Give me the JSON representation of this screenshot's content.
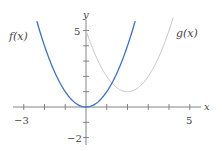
{
  "chart_data": {
    "type": "line",
    "title": "",
    "xlabel": "x",
    "ylabel": "y",
    "xlim": [
      -4,
      6
    ],
    "ylim": [
      -2.5,
      6
    ],
    "grid": false,
    "x_ticks": [
      -3,
      -2,
      -1,
      0,
      1,
      2,
      3,
      4,
      5
    ],
    "y_ticks": [
      -2,
      -1,
      0,
      1,
      2,
      3,
      4,
      5
    ],
    "x_tick_labels": [
      {
        "value": -3,
        "label": "−3"
      },
      {
        "value": 5,
        "label": "5"
      }
    ],
    "y_tick_labels": [
      {
        "value": 5,
        "label": "5"
      },
      {
        "value": -2,
        "label": "−2"
      }
    ],
    "series": [
      {
        "name": "f(x)",
        "formula": "x^2",
        "color": "#3b73c4",
        "x": [
          -2.37,
          -2,
          -1.5,
          -1,
          -0.5,
          0,
          0.5,
          1,
          1.5,
          2,
          2.37
        ],
        "values": [
          5.6,
          4,
          2.25,
          1,
          0.25,
          0,
          0.25,
          1,
          2.25,
          4,
          5.6
        ]
      },
      {
        "name": "g(x)",
        "formula": "(x-2)^2+1",
        "color": "#c4c4c4",
        "x": [
          0,
          0.5,
          1,
          1.5,
          2,
          2.5,
          3,
          3.5,
          4,
          4.2
        ],
        "values": [
          5,
          3.25,
          2,
          1.25,
          1,
          1.25,
          2,
          3.25,
          5,
          5.84
        ]
      }
    ],
    "annotations": [
      {
        "text": "f(x)",
        "near": "left branch of f"
      },
      {
        "text": "g(x)",
        "near": "right branch of g"
      }
    ]
  },
  "labels": {
    "f": "f(x)",
    "g": "g(x)",
    "x_axis": "x",
    "y_axis": "y",
    "x_neg3": "−3",
    "x_5": "5",
    "y_5": "5",
    "y_neg2": "−2"
  }
}
